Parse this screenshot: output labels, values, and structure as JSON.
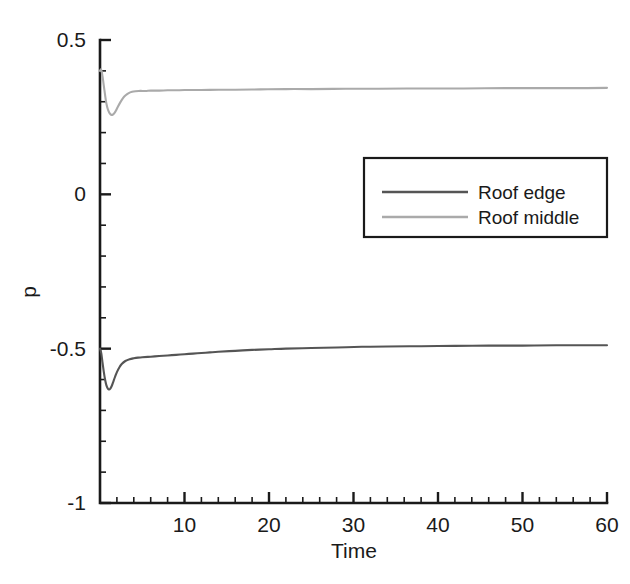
{
  "chart_data": {
    "type": "line",
    "title": "",
    "xlabel": "Time",
    "ylabel": "p",
    "xlim": [
      0,
      60
    ],
    "ylim": [
      -1,
      0.5
    ],
    "grid": false,
    "legend_position": "upper right inside",
    "x_ticks": [
      10,
      20,
      30,
      40,
      50,
      60
    ],
    "x_tick_labels": [
      "10",
      "20",
      "30",
      "40",
      "50",
      "60"
    ],
    "x_minor_tick_step": 2,
    "y_ticks": [
      0.5,
      0,
      -0.5,
      -1
    ],
    "y_tick_labels": [
      "0.5",
      "0",
      "-0.5",
      "-1"
    ],
    "y_minor_tick_step": 0.1,
    "series": [
      {
        "name": "Roof edge",
        "color": "#555555",
        "x": [
          0.0,
          0.15,
          0.3,
          0.45,
          0.6,
          0.75,
          0.9,
          1.05,
          1.2,
          1.4,
          1.6,
          1.8,
          2.0,
          2.3,
          2.6,
          3.0,
          3.5,
          4.0,
          4.5,
          5.0,
          6.0,
          7.0,
          8.0,
          9.0,
          10.0,
          11.0,
          12.0,
          13.0,
          14.0,
          16.0,
          18.0,
          20.0,
          22.0,
          25.0,
          28.0,
          31.0,
          34.0,
          38.0,
          42.0,
          46.0,
          50.0,
          54.0,
          57.0,
          60.0
        ],
        "y": [
          -0.5,
          -0.515,
          -0.545,
          -0.575,
          -0.6,
          -0.618,
          -0.628,
          -0.632,
          -0.63,
          -0.62,
          -0.605,
          -0.59,
          -0.576,
          -0.56,
          -0.549,
          -0.54,
          -0.534,
          -0.531,
          -0.529,
          -0.528,
          -0.526,
          -0.524,
          -0.522,
          -0.52,
          -0.518,
          -0.516,
          -0.514,
          -0.512,
          -0.51,
          -0.507,
          -0.504,
          -0.502,
          -0.5,
          -0.498,
          -0.496,
          -0.494,
          -0.493,
          -0.492,
          -0.491,
          -0.49,
          -0.49,
          -0.489,
          -0.489,
          -0.489
        ]
      },
      {
        "name": "Roof middle",
        "color": "#aaaaaa",
        "x": [
          0.0,
          0.1,
          0.2,
          0.3,
          0.4,
          0.5,
          0.6,
          0.7,
          0.85,
          1.0,
          1.15,
          1.3,
          1.5,
          1.7,
          1.9,
          2.1,
          2.4,
          2.7,
          3.0,
          3.4,
          3.8,
          4.2,
          4.6,
          5.0,
          5.5,
          6.0,
          7.0,
          8.0,
          9.0,
          10.0,
          12.0,
          14.0,
          16.0,
          19.0,
          22.0,
          25.0,
          29.0,
          33.0,
          38.0,
          43.0,
          48.0,
          53.0,
          57.0,
          60.0
        ],
        "y": [
          0.4,
          0.405,
          0.398,
          0.382,
          0.362,
          0.342,
          0.322,
          0.303,
          0.283,
          0.27,
          0.262,
          0.258,
          0.258,
          0.263,
          0.272,
          0.283,
          0.298,
          0.311,
          0.32,
          0.328,
          0.332,
          0.334,
          0.335,
          0.335,
          0.335,
          0.336,
          0.336,
          0.337,
          0.337,
          0.338,
          0.338,
          0.339,
          0.339,
          0.34,
          0.341,
          0.341,
          0.342,
          0.342,
          0.343,
          0.343,
          0.344,
          0.344,
          0.344,
          0.345
        ]
      }
    ]
  },
  "legend": {
    "entries": [
      {
        "label": "Roof edge"
      },
      {
        "label": "Roof middle"
      }
    ]
  },
  "axes": {
    "x_title": "Time",
    "y_title": "p"
  }
}
